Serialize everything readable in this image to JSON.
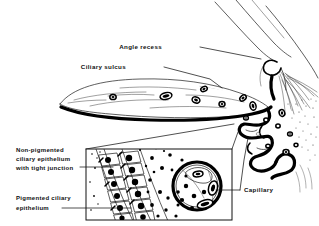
{
  "figure": {
    "type": "line-drawing",
    "background_color": "#ffffff",
    "ink_color": "#000000",
    "width": 319,
    "height": 226
  },
  "labels": {
    "angle_recess": "Angle recess",
    "ciliary_sulcus": "Ciliary sulcus",
    "capillary": "Capillary",
    "non_pigmented_line1": "Non-pigmented",
    "non_pigmented_line2": "ciliary epithelium",
    "non_pigmented_line3": "with tight junction",
    "pigmented_line1": "Pigmented ciliary",
    "pigmented_line2": "epithelium"
  },
  "structures": {
    "iris_ciliary_body": "iris-ciliary-body-mass",
    "angle_recess_notch": "angle-recess-notch",
    "ciliary_processes": "ciliary-processes-folds",
    "zonular_fibers": "zonular-fiber-bundles",
    "sclera_cornea_lines": "sclera-cornea-outline",
    "inset_box": "epithelium-detail-inset",
    "inset_cells_npe": "non-pigmented-epithelium-cell-column",
    "inset_cells_pe": "pigmented-epithelium-cell-column",
    "inset_capillary": "capillary-cross-section",
    "inset_rbc": "red-blood-cells",
    "inset_stroma_dots": "stromal-granules"
  },
  "inset": {
    "cell_count_outer": 6,
    "cell_count_inner": 6,
    "rbc_count": 3,
    "frame_x": 85,
    "frame_y": 148,
    "frame_w": 148,
    "frame_h": 73
  }
}
